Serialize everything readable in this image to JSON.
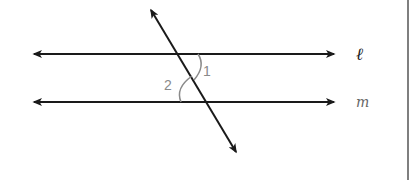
{
  "diagram": {
    "type": "geometry",
    "lines": [
      {
        "id": "l",
        "label": "ℓ",
        "y": 54
      },
      {
        "id": "m",
        "label": "m",
        "y": 102
      }
    ],
    "transversal": {
      "from": [
        151,
        10
      ],
      "to": [
        236,
        152
      ]
    },
    "angles": [
      {
        "id": "1",
        "label": "1",
        "position": "between lines, right of transversal at line ℓ"
      },
      {
        "id": "2",
        "label": "2",
        "position": "between lines, left of transversal at line m"
      }
    ],
    "colors": {
      "line": "#1a1a1a",
      "angle": "#8a8a8a",
      "border": "#555555"
    }
  }
}
